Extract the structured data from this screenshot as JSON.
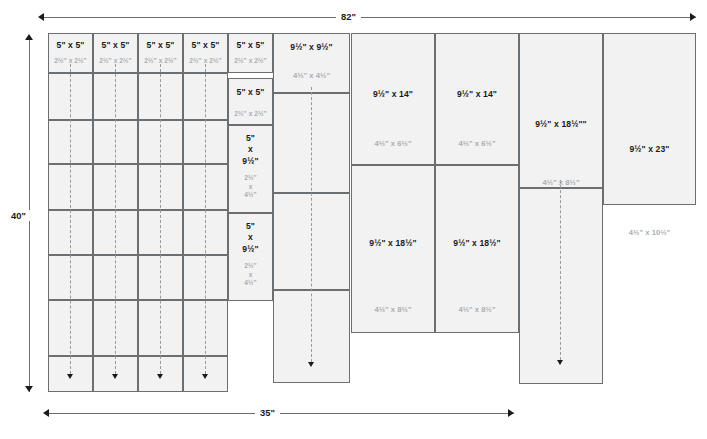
{
  "diagram": {
    "fill_color": "#f2f2f2",
    "border_color": "#6b6f72",
    "primary_label_color": "#1b1b1b",
    "secondary_label_color": "#a9adb0"
  },
  "dimensions": {
    "top": "82\"",
    "left": "40\"",
    "bottom": "35\""
  },
  "pieces": [
    {
      "id": "c1r1",
      "primary": "5\" x 5\"",
      "secondary": "2½\" x 2½\""
    },
    {
      "id": "c2r1",
      "primary": "5\" x 5\"",
      "secondary": "2½\" x 2½\""
    },
    {
      "id": "c3r1",
      "primary": "5\" x 5\"",
      "secondary": "2½\" x 2½\""
    },
    {
      "id": "c4r1",
      "primary": "5\" x 5\"",
      "secondary": "2½\" x 2½\""
    },
    {
      "id": "c5r1",
      "primary": "5\" x 5\"",
      "secondary": "2½\" x 2½\""
    },
    {
      "id": "c5r2",
      "primary": "5\" x 5\"",
      "secondary": "2½\" x 2½\""
    },
    {
      "id": "c5r3",
      "primary": "5\"\nx\n9½\"",
      "secondary": "2½\"\nx\n4½\""
    },
    {
      "id": "c5r4",
      "primary": "5\"\nx\n9½\"",
      "secondary": "2½\"\nx\n4½\""
    },
    {
      "id": "c6r1",
      "primary": "9½\" x 9½\"",
      "secondary": "4½\" x 4½\""
    },
    {
      "id": "c7r1",
      "primary": "9½\" x 14\"",
      "secondary": "4½\" x 6½\""
    },
    {
      "id": "c7r2",
      "primary": "9½\" x 18½\"",
      "secondary": "4½\" x 8½\""
    },
    {
      "id": "c8r1",
      "primary": "9½\" x 14\"",
      "secondary": "4½\" x 6½\""
    },
    {
      "id": "c8r2",
      "primary": "9½\" x 18½\"",
      "secondary": "4½\" x 8½\""
    },
    {
      "id": "c9r1",
      "primary": "9½\" x 18½\"\"",
      "secondary": "4½\" x 8½\""
    },
    {
      "id": "c10r1",
      "primary": "9½\" x 23\"",
      "secondary": "4½\" x 10½\""
    }
  ]
}
